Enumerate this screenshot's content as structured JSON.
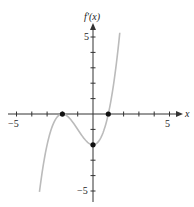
{
  "chart_data": {
    "type": "line",
    "title": "",
    "xlabel": "x",
    "ylabel": "f'(x)",
    "xlim": [
      -5,
      5
    ],
    "ylim": [
      -5,
      5
    ],
    "grid": false,
    "tick_step": 1,
    "x_tick_labels": [
      "-5",
      "5"
    ],
    "y_tick_labels": [
      "5",
      "-5"
    ],
    "series": [
      {
        "name": "f'(x)",
        "x": [
          -3.5,
          -3,
          -2.5,
          -2,
          -1.5,
          -1,
          -0.5,
          0,
          0.5,
          1,
          1.5,
          1.75
        ],
        "values": [
          -5.06,
          -2.0,
          -0.44,
          0,
          -0.31,
          -1.0,
          -1.69,
          -2.0,
          -1.56,
          0,
          3.06,
          5.36
        ],
        "color": "#bbbbbb"
      }
    ],
    "highlighted_points": [
      {
        "x": -2,
        "y": 0
      },
      {
        "x": 0,
        "y": -2
      },
      {
        "x": 1,
        "y": 0
      }
    ]
  },
  "labels": {
    "ylabel": "f′(x)",
    "xlabel": "x",
    "x_neg5": "−5",
    "x_pos5": "5",
    "y_pos5": "5",
    "y_neg5": "−5"
  }
}
